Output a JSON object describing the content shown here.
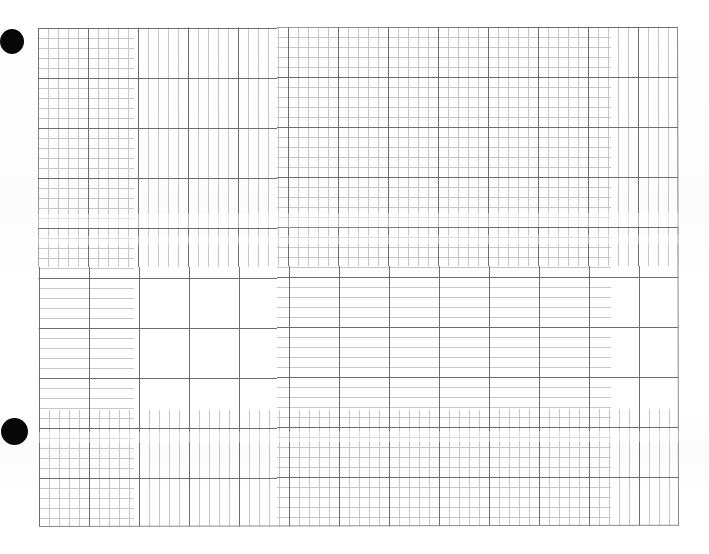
{
  "document": {
    "kind": "graph-paper-scan",
    "title": "Blank graph paper",
    "background_color": "#ffffff",
    "width": 709,
    "height": 554,
    "text_content": [],
    "annotations": [],
    "plotted_data": []
  },
  "grid": {
    "label": "Graph paper grid",
    "left": 38,
    "top": 28,
    "width": 640,
    "height": 499,
    "minor_cell_px": 10,
    "major_cell_px": 50,
    "minor_cells_across": 64,
    "minor_cells_down": 50,
    "major_cells_across": 13,
    "major_cells_down": 10,
    "minor_line_color": "#c6c6c6",
    "major_line_color": "#6d6d6d",
    "edge_line_color": "#8a8a8a",
    "rotation_deg": -0.12
  },
  "punch_holes": {
    "label": "Binder punch holes",
    "color": "#080808",
    "items": [
      {
        "name": "top-hole",
        "cx": 12,
        "cy": 41,
        "rx": 12,
        "ry": 12.5
      },
      {
        "name": "bottom-hole",
        "cx": 14,
        "cy": 431,
        "rx": 13.5,
        "ry": 13.5
      }
    ]
  },
  "scan_artifacts": {
    "label": "Scanner banding",
    "bands": [
      {
        "name": "band-a",
        "top": 214,
        "height": 14
      },
      {
        "name": "band-b",
        "top": 236,
        "height": 9
      },
      {
        "name": "band-c",
        "top": 432,
        "height": 11
      }
    ]
  },
  "chart_data": {
    "type": "table",
    "title": "",
    "subtitle": "",
    "xlabel": "",
    "ylabel": "",
    "categories": [],
    "values": [],
    "series": [],
    "legend": [],
    "tick_labels_x": [],
    "tick_labels_y": [],
    "grid": true
  }
}
